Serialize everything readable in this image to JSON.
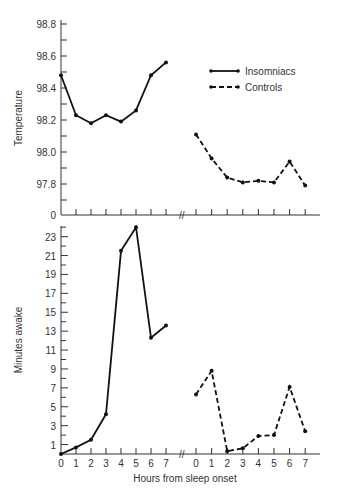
{
  "chart_data": [
    {
      "type": "line",
      "panel": "top",
      "title": "",
      "xlabel": "",
      "ylabel": "Temperature",
      "ylim": [
        97.6,
        98.8
      ],
      "y_ticks_labeled": [
        "98.8",
        "98.6",
        "98.4",
        "98.2",
        "98.0",
        "97.8",
        "0"
      ],
      "y_axis_break": "axis origin labeled 0 below 97.8",
      "x_groups": [
        {
          "name": "Insomniacs",
          "x": [
            0,
            1,
            2,
            3,
            4,
            5,
            6,
            7
          ]
        },
        {
          "name": "Controls",
          "x": [
            0,
            1,
            2,
            3,
            4,
            5,
            6,
            7
          ]
        }
      ],
      "grid": false,
      "series": [
        {
          "name": "Insomniacs",
          "style": "solid",
          "x": [
            0,
            1,
            2,
            3,
            4,
            5,
            6,
            7
          ],
          "values": [
            98.48,
            98.23,
            98.18,
            98.23,
            98.19,
            98.26,
            98.48,
            98.56
          ]
        },
        {
          "name": "Controls",
          "style": "dashed",
          "x": [
            0,
            1,
            2,
            3,
            4,
            5,
            6,
            7
          ],
          "values": [
            98.11,
            97.96,
            97.84,
            97.81,
            97.82,
            97.81,
            97.94,
            97.79
          ]
        }
      ],
      "legend": {
        "position": "upper right",
        "entries": [
          "Insomniacs",
          "Controls"
        ]
      }
    },
    {
      "type": "line",
      "panel": "bottom",
      "title": "",
      "xlabel": "Hours from sleep onset",
      "ylabel": "Minutes awake",
      "ylim": [
        0,
        24
      ],
      "y_ticks_labeled": [
        "23",
        "21",
        "19",
        "17",
        "15",
        "13",
        "11",
        "9",
        "7",
        "5",
        "3",
        "1"
      ],
      "x_tick_labels": [
        "0",
        "1",
        "2",
        "3",
        "4",
        "5",
        "6",
        "7"
      ],
      "x_axis_break": "//",
      "grid": false,
      "series": [
        {
          "name": "Insomniacs",
          "style": "solid",
          "x": [
            0,
            1,
            2,
            3,
            4,
            5,
            6,
            7
          ],
          "values": [
            0.0,
            0.7,
            1.5,
            4.2,
            21.5,
            24.0,
            12.3,
            13.6
          ]
        },
        {
          "name": "Controls",
          "style": "dashed",
          "x": [
            0,
            1,
            2,
            3,
            4,
            5,
            6,
            7
          ],
          "values": [
            6.3,
            8.8,
            0.3,
            0.6,
            1.9,
            2.0,
            7.1,
            2.4
          ]
        }
      ]
    }
  ],
  "labels": {
    "top_ylabel": "Temperature",
    "bottom_ylabel": "Minutes awake",
    "xlabel": "Hours from sleep onset",
    "legend_insomniacs": "Insomniacs",
    "legend_controls": "Controls",
    "axis_break": "//"
  }
}
